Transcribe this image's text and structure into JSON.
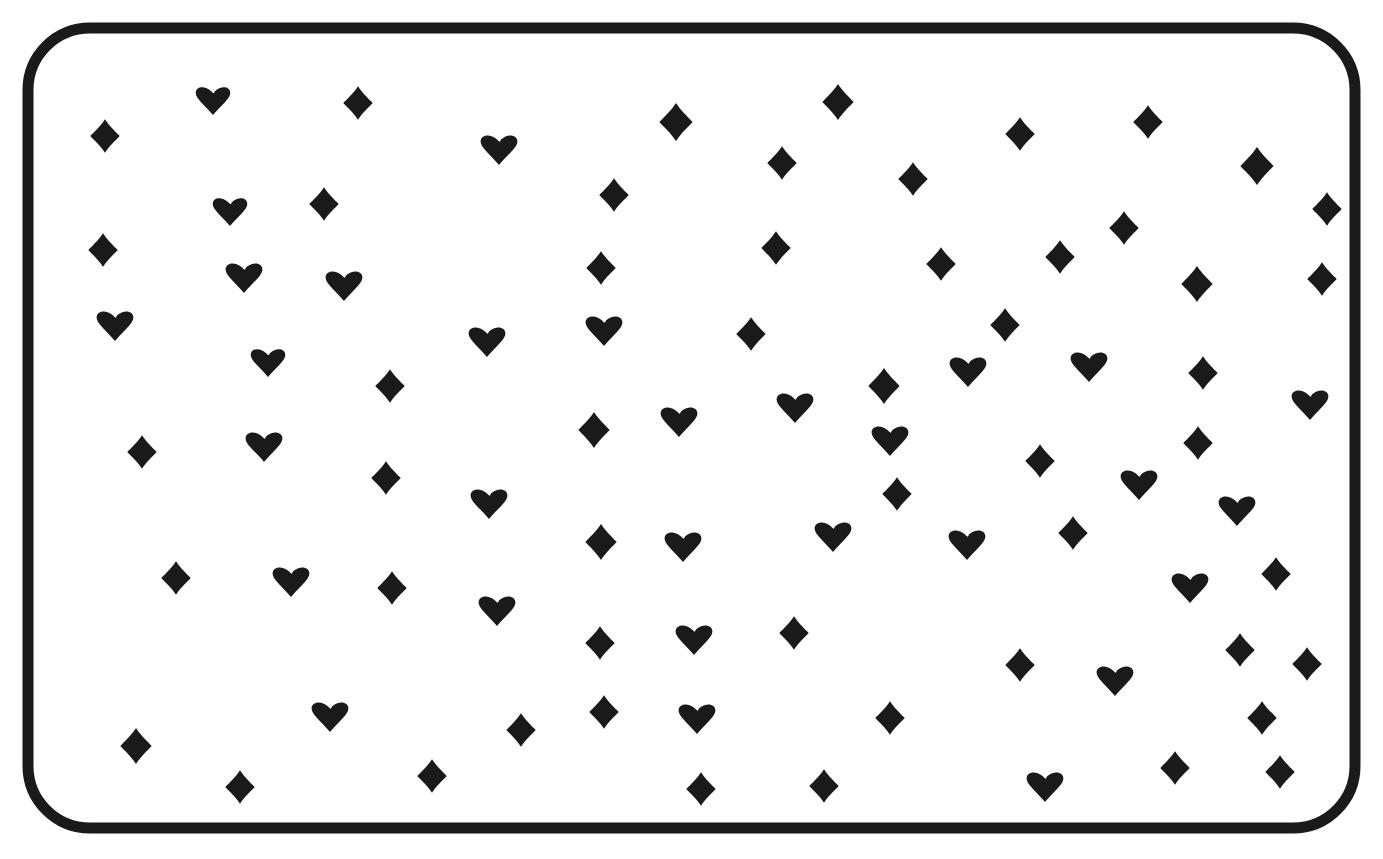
{
  "page": {
    "kind": "worksheet",
    "background_color": "#ffffff",
    "ink_color": "#1a1a1a",
    "canvas": {
      "width": 1383,
      "height": 859
    }
  },
  "frame": {
    "name": "rounded-rectangle-border",
    "stroke_color": "#1a1a1a",
    "stroke_width": 11,
    "x": 28,
    "y": 28,
    "width": 1327,
    "height": 800,
    "corner_radius": 62
  },
  "symbols": {
    "heart_glyph": "♥",
    "diamond_glyph": "♦",
    "fill_color": "#1a1a1a",
    "heart_count": 40,
    "diamond_count": 73,
    "total_count": 113,
    "items": [
      {
        "t": "d",
        "x": 105,
        "y": 136,
        "s": 15
      },
      {
        "t": "h",
        "x": 213,
        "y": 100,
        "s": 15
      },
      {
        "t": "d",
        "x": 358,
        "y": 103,
        "s": 15
      },
      {
        "t": "h",
        "x": 499,
        "y": 149,
        "s": 16
      },
      {
        "t": "d",
        "x": 676,
        "y": 122,
        "s": 17
      },
      {
        "t": "d",
        "x": 838,
        "y": 102,
        "s": 16
      },
      {
        "t": "d",
        "x": 1020,
        "y": 134,
        "s": 15
      },
      {
        "t": "d",
        "x": 1148,
        "y": 122,
        "s": 15
      },
      {
        "t": "d",
        "x": 1257,
        "y": 166,
        "s": 17
      },
      {
        "t": "h",
        "x": 230,
        "y": 211,
        "s": 15
      },
      {
        "t": "d",
        "x": 324,
        "y": 204,
        "s": 15
      },
      {
        "t": "d",
        "x": 614,
        "y": 195,
        "s": 15
      },
      {
        "t": "d",
        "x": 782,
        "y": 163,
        "s": 15
      },
      {
        "t": "d",
        "x": 913,
        "y": 179,
        "s": 15
      },
      {
        "t": "d",
        "x": 1327,
        "y": 209,
        "s": 15
      },
      {
        "t": "d",
        "x": 103,
        "y": 250,
        "s": 15
      },
      {
        "t": "h",
        "x": 244,
        "y": 277,
        "s": 16
      },
      {
        "t": "h",
        "x": 344,
        "y": 285,
        "s": 16
      },
      {
        "t": "d",
        "x": 601,
        "y": 268,
        "s": 15
      },
      {
        "t": "d",
        "x": 776,
        "y": 248,
        "s": 15
      },
      {
        "t": "d",
        "x": 941,
        "y": 264,
        "s": 15
      },
      {
        "t": "d",
        "x": 1060,
        "y": 257,
        "s": 15
      },
      {
        "t": "d",
        "x": 1124,
        "y": 228,
        "s": 15
      },
      {
        "t": "h",
        "x": 115,
        "y": 325,
        "s": 16
      },
      {
        "t": "h",
        "x": 268,
        "y": 362,
        "s": 15
      },
      {
        "t": "d",
        "x": 390,
        "y": 386,
        "s": 15
      },
      {
        "t": "h",
        "x": 487,
        "y": 341,
        "s": 16
      },
      {
        "t": "h",
        "x": 604,
        "y": 330,
        "s": 16
      },
      {
        "t": "d",
        "x": 751,
        "y": 334,
        "s": 15
      },
      {
        "t": "d",
        "x": 1005,
        "y": 325,
        "s": 15
      },
      {
        "t": "d",
        "x": 1197,
        "y": 284,
        "s": 16
      },
      {
        "t": "d",
        "x": 1322,
        "y": 279,
        "s": 15
      },
      {
        "t": "d",
        "x": 884,
        "y": 386,
        "s": 16
      },
      {
        "t": "h",
        "x": 968,
        "y": 371,
        "s": 16
      },
      {
        "t": "h",
        "x": 1089,
        "y": 366,
        "s": 16
      },
      {
        "t": "d",
        "x": 1203,
        "y": 373,
        "s": 15
      },
      {
        "t": "h",
        "x": 1310,
        "y": 404,
        "s": 16
      },
      {
        "t": "d",
        "x": 142,
        "y": 452,
        "s": 15
      },
      {
        "t": "h",
        "x": 264,
        "y": 446,
        "s": 16
      },
      {
        "t": "d",
        "x": 386,
        "y": 478,
        "s": 15
      },
      {
        "t": "d",
        "x": 594,
        "y": 430,
        "s": 16
      },
      {
        "t": "h",
        "x": 679,
        "y": 421,
        "s": 16
      },
      {
        "t": "h",
        "x": 795,
        "y": 407,
        "s": 16
      },
      {
        "t": "h",
        "x": 890,
        "y": 440,
        "s": 16
      },
      {
        "t": "d",
        "x": 1040,
        "y": 461,
        "s": 15
      },
      {
        "t": "d",
        "x": 1198,
        "y": 443,
        "s": 15
      },
      {
        "t": "h",
        "x": 489,
        "y": 503,
        "s": 16
      },
      {
        "t": "d",
        "x": 897,
        "y": 494,
        "s": 15
      },
      {
        "t": "h",
        "x": 1139,
        "y": 484,
        "s": 16
      },
      {
        "t": "d",
        "x": 601,
        "y": 542,
        "s": 16
      },
      {
        "t": "h",
        "x": 683,
        "y": 546,
        "s": 16
      },
      {
        "t": "h",
        "x": 833,
        "y": 536,
        "s": 16
      },
      {
        "t": "h",
        "x": 967,
        "y": 544,
        "s": 16
      },
      {
        "t": "d",
        "x": 1073,
        "y": 533,
        "s": 15
      },
      {
        "t": "h",
        "x": 1237,
        "y": 510,
        "s": 16
      },
      {
        "t": "d",
        "x": 176,
        "y": 578,
        "s": 15
      },
      {
        "t": "h",
        "x": 291,
        "y": 581,
        "s": 16
      },
      {
        "t": "d",
        "x": 392,
        "y": 588,
        "s": 15
      },
      {
        "t": "h",
        "x": 497,
        "y": 610,
        "s": 16
      },
      {
        "t": "h",
        "x": 1190,
        "y": 587,
        "s": 16
      },
      {
        "t": "d",
        "x": 1276,
        "y": 574,
        "s": 15
      },
      {
        "t": "d",
        "x": 600,
        "y": 643,
        "s": 15
      },
      {
        "t": "h",
        "x": 694,
        "y": 639,
        "s": 16
      },
      {
        "t": "d",
        "x": 794,
        "y": 633,
        "s": 15
      },
      {
        "t": "d",
        "x": 1020,
        "y": 665,
        "s": 15
      },
      {
        "t": "h",
        "x": 1115,
        "y": 680,
        "s": 16
      },
      {
        "t": "d",
        "x": 1240,
        "y": 650,
        "s": 15
      },
      {
        "t": "d",
        "x": 1307,
        "y": 664,
        "s": 15
      },
      {
        "t": "d",
        "x": 136,
        "y": 746,
        "s": 16
      },
      {
        "t": "h",
        "x": 330,
        "y": 716,
        "s": 16
      },
      {
        "t": "d",
        "x": 521,
        "y": 730,
        "s": 15
      },
      {
        "t": "d",
        "x": 604,
        "y": 712,
        "s": 15
      },
      {
        "t": "h",
        "x": 697,
        "y": 718,
        "s": 16
      },
      {
        "t": "d",
        "x": 890,
        "y": 718,
        "s": 15
      },
      {
        "t": "h",
        "x": 1045,
        "y": 786,
        "s": 16
      },
      {
        "t": "d",
        "x": 1175,
        "y": 768,
        "s": 15
      },
      {
        "t": "d",
        "x": 1280,
        "y": 772,
        "s": 15
      },
      {
        "t": "d",
        "x": 240,
        "y": 787,
        "s": 15
      },
      {
        "t": "d",
        "x": 432,
        "y": 776,
        "s": 15
      },
      {
        "t": "d",
        "x": 701,
        "y": 789,
        "s": 15
      },
      {
        "t": "d",
        "x": 824,
        "y": 786,
        "s": 15
      },
      {
        "t": "d",
        "x": 1262,
        "y": 718,
        "s": 15
      }
    ]
  },
  "lines": {
    "description": "Hand-drawn curved and straight dividers partitioning the frame into regions",
    "region_count": 84,
    "paths": [
      "M 31 186 C 70 192, 140 196, 176 160 C 204 132, 207 82, 198 40",
      "M 178 38 C 175 160, 200 330, 216 480 C 232 620, 248 720, 252 812",
      "M 266 36 C 268 140, 278 300, 294 450 C 312 610, 330 730, 336 818",
      "M 265 48 L 367 190 L 460 50",
      "M 458 38 C 452 150, 448 300, 452 420 C 456 560, 470 700, 488 820",
      "M 546 36 C 560 140, 584 260, 600 360 C 618 470, 624 600, 618 700 C 614 770, 600 800, 580 822",
      "M 610 40 C 628 100, 672 160, 718 206 C 772 262, 840 320, 876 400 C 908 474, 912 580, 910 660 C 908 730, 918 780, 936 822",
      "M 728 40 C 722 100, 706 160, 688 210 C 662 280, 640 345, 640 420 C 640 520, 652 620, 662 700 C 672 770, 680 800, 684 822",
      "M 880 36 C 892 100, 918 165, 960 230 C 1010 306, 1060 400, 1088 500 C 1110 580, 1112 680, 1100 760 C 1092 800, 1082 812, 1074 822",
      "M 930 38 C 940 140, 958 300, 978 430 C 1000 580, 1030 700, 1062 780 C 1080 820, 1090 826, 1096 828",
      "M 1066 36 C 1080 140, 1106 290, 1134 420 C 1166 570, 1200 690, 1232 770 C 1248 810, 1258 822, 1266 828",
      "M 1266 36 C 1268 60, 1272 86, 1280 106",
      "M 1198 166 m -58 0 a 58 58 0 1 0 116 0 a 58 58 0 1 0 -116 0",
      "M 31 304 C 120 296, 220 286, 320 276 C 420 266, 520 268, 620 282 C 720 296, 820 306, 900 300 C 990 292, 1090 268, 1180 250 C 1260 234, 1320 224, 1352 220",
      "M 316 276 L 414 272 L 416 306 L 320 312",
      "M 31 374 C 110 372, 210 378, 300 392 C 400 408, 500 440, 600 464 C 700 488, 800 496, 900 484 C 1010 470, 1120 438, 1220 412 C 1300 392, 1340 386, 1356 384",
      "M 34 494 C 120 498, 230 512, 330 532 C 440 554, 540 580, 640 600 C 740 620, 840 630, 940 634 C 1040 638, 1140 640, 1230 644",
      "M 33 614 C 110 606, 220 596, 330 600 C 450 604, 560 622, 660 646 C 760 670, 860 682, 960 682 C 1060 682, 1160 672, 1240 660",
      "M 31 654 C 120 662, 230 676, 330 690 C 440 704, 540 716, 640 722 C 740 728, 840 728, 930 726",
      "M 538 420 C 538 388, 556 366, 580 362 C 606 358, 628 376, 634 404 C 638 424, 638 460, 638 500",
      "M 538 420 C 538 470, 540 540, 542 610 C 544 690, 546 770, 546 826",
      "M 492 362 C 520 330, 560 306, 606 300 C 660 294, 712 316, 744 356 C 770 388, 780 430, 780 470",
      "M 748 440 C 748 372, 800 322, 880 310 C 960 298, 1030 334, 1060 400 C 1090 466, 1072 546, 1010 592 C 950 636, 866 634, 812 592",
      "M 748 440 C 748 500, 776 552, 826 582",
      "M 830 440 m -55 -66 a 55 66 0 1 0 110 0 a 55 66 0 1 0 -110 0",
      "M 900 446 C 960 452, 1040 464, 1120 488 C 1200 512, 1250 540, 1274 566",
      "M 1274 566 C 1300 596, 1300 640, 1276 672 C 1248 710, 1196 736, 1140 752 C 1080 768, 1020 774, 978 776",
      "M 1180 396 C 1210 420, 1238 456, 1252 500 C 1266 548, 1262 604, 1240 652 C 1218 700, 1180 744, 1140 776 C 1108 802, 1082 818, 1068 826",
      "M 1354 540 C 1320 548, 1270 562, 1220 582 C 1160 606, 1104 640, 1060 678 C 1016 716, 986 760, 972 800 C 966 818, 964 826, 964 828",
      "M 1354 694 C 1310 700, 1250 700, 1200 686 C 1140 670, 1086 638, 1042 600 C 1002 566, 972 528, 954 494",
      "M 1354 448 C 1310 450, 1250 456, 1200 468",
      "M 862 804 C 874 778, 868 752, 842 742 C 812 732, 786 748, 778 776 C 774 794, 774 812, 776 826",
      "M 1354 300 C 1310 304, 1250 312, 1200 324",
      "M 954 494 C 936 460, 926 430, 924 404"
    ]
  }
}
